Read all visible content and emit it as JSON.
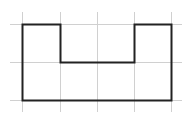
{
  "diagram": {
    "type": "grid-polygon",
    "background": "#ffffff",
    "grid": {
      "color": "#d0d0d0",
      "stroke_width": 1,
      "vertical_lines_x": [
        22,
        60,
        97,
        134,
        171
      ],
      "horizontal_lines_y": [
        24,
        62,
        100
      ],
      "x_extent": [
        10,
        182
      ],
      "y_extent": [
        12,
        112
      ]
    },
    "shape": {
      "name": "u-shaped-polygon",
      "stroke": "#222222",
      "stroke_width": 2,
      "fill": "none",
      "grid_units": [
        [
          0,
          0
        ],
        [
          1,
          0
        ],
        [
          1,
          1
        ],
        [
          3,
          1
        ],
        [
          3,
          0
        ],
        [
          4,
          0
        ],
        [
          4,
          2
        ],
        [
          0,
          2
        ]
      ],
      "points": [
        [
          22,
          24
        ],
        [
          60,
          24
        ],
        [
          60,
          62
        ],
        [
          134,
          62
        ],
        [
          134,
          24
        ],
        [
          171,
          24
        ],
        [
          171,
          100
        ],
        [
          22,
          100
        ]
      ]
    }
  }
}
